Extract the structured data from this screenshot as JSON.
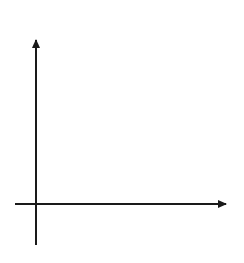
{
  "chart_data": {
    "type": "line",
    "title": "",
    "xlabel": "x",
    "ylabel": "y",
    "xlim": [
      -1,
      9
    ],
    "ylim": [
      -2,
      8
    ],
    "grid": true,
    "tick_labels_shown": false,
    "series": [
      {
        "name": "g(x) = |x − 5|",
        "x": [
          -1,
          5,
          9
        ],
        "y": [
          6,
          0,
          4
        ],
        "color": "#9a9a9a",
        "arrows_at_ends": true
      }
    ],
    "annotations": [
      {
        "text": "g(x) = |x − 5|",
        "x": 2.5,
        "y": 3.6
      }
    ]
  },
  "labels": {
    "x_axis": "x",
    "y_axis": "y",
    "function_prefix": "g",
    "function_open": "(",
    "function_var": "x",
    "function_close": ") = |",
    "function_var2": "x",
    "function_rest": " − 5|"
  },
  "colors": {
    "grid": "#d4d4d4",
    "axis": "#1a1a1a",
    "curve": "#9a9a9a",
    "label": "#a8a8a8"
  }
}
